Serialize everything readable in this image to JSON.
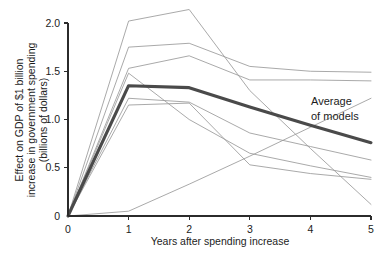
{
  "chart_data": {
    "type": "line",
    "title": "",
    "xlabel": "Years after spending increase",
    "ylabel": "Effect on GDP of $1 billion increase in government spending (billions of dollars)",
    "ylabel_line1": "Effect on GDP of $1 billion",
    "ylabel_line2": "increase in government spending",
    "ylabel_line3": "(billions of dollars)",
    "x": [
      0,
      1,
      2,
      3,
      4,
      5
    ],
    "xlim": [
      0,
      5
    ],
    "ylim": [
      0,
      2.1
    ],
    "xticks": [
      "0",
      "1",
      "2",
      "3",
      "4",
      "5"
    ],
    "yticks": [
      "0",
      "0.5",
      "1.0",
      "1.5",
      "2.0"
    ],
    "ytick_values": [
      0,
      0.5,
      1.0,
      1.5,
      2.0
    ],
    "grid": false,
    "legend": "none",
    "annotations": [
      {
        "name": "average-of-models",
        "line1": "Average",
        "line2": "of models",
        "x": 4.05,
        "y": 1.12
      }
    ],
    "series": [
      {
        "name": "Average of models",
        "emphasis": "thick",
        "color": "#4a4a4a",
        "values": [
          0.0,
          1.35,
          1.33,
          1.13,
          0.94,
          0.76
        ]
      },
      {
        "name": "Model 1",
        "emphasis": "thin",
        "color": "#9a9a9a",
        "values": [
          0.0,
          2.02,
          2.14,
          1.3,
          0.7,
          0.12
        ]
      },
      {
        "name": "Model 2",
        "emphasis": "thin",
        "color": "#9a9a9a",
        "values": [
          0.0,
          1.75,
          1.79,
          1.55,
          1.5,
          1.49
        ]
      },
      {
        "name": "Model 3",
        "emphasis": "thin",
        "color": "#9a9a9a",
        "values": [
          0.0,
          1.53,
          1.66,
          1.41,
          1.41,
          1.4
        ]
      },
      {
        "name": "Model 4",
        "emphasis": "thin",
        "color": "#9a9a9a",
        "values": [
          0.0,
          1.48,
          1.0,
          0.65,
          0.52,
          0.4
        ]
      },
      {
        "name": "Model 5",
        "emphasis": "thin",
        "color": "#9a9a9a",
        "values": [
          0.0,
          1.22,
          1.18,
          0.86,
          0.72,
          0.58
        ]
      },
      {
        "name": "Model 6",
        "emphasis": "thin",
        "color": "#9a9a9a",
        "values": [
          0.0,
          1.15,
          1.17,
          0.53,
          0.44,
          0.38
        ]
      },
      {
        "name": "Model 7",
        "emphasis": "thin",
        "color": "#9a9a9a",
        "values": [
          0.0,
          0.05,
          0.33,
          0.62,
          0.92,
          1.22
        ]
      }
    ]
  }
}
